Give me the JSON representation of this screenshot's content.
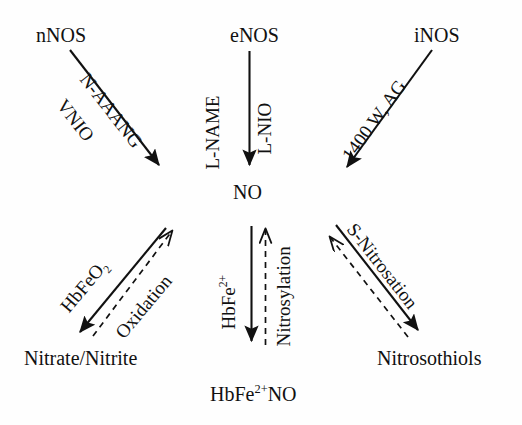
{
  "diagram": {
    "background_color": "#fefefe",
    "stroke_color": "#111111",
    "nodes": {
      "nnos": "nNOS",
      "enos": "eNOS",
      "inos": "iNOS",
      "no": "NO",
      "nitrate_nitrite": "Nitrate/Nitrite",
      "hbfe_no": "HbFe",
      "hbfe_no_sup": "2+",
      "hbfe_no_tail": "NO",
      "nitrosothiols": "Nitrosothiols"
    },
    "edge_labels": {
      "n_aaang": "N-AAANG",
      "vnio": "VNIO",
      "l_name": "L-NAME",
      "l_nio": "L-NIO",
      "w1400_ag": "1400 W, AG",
      "hbfeo2": "HbFeO",
      "hbfeo2_sub": "2",
      "oxidation": "Oxidation",
      "hbfe2": "HbFe",
      "hbfe2_sup": "2+",
      "nitrosylation": "Nitrosylation",
      "s_nitrosation": "S-Nitrosation"
    },
    "edges": [
      {
        "name": "nnos-to-no",
        "from": "nNOS",
        "to": "NO",
        "style": "solid",
        "inhibitors": [
          "N-AAANG",
          "VNIO"
        ]
      },
      {
        "name": "enos-to-no",
        "from": "eNOS",
        "to": "NO",
        "style": "solid",
        "inhibitors": [
          "L-NAME",
          "L-NIO"
        ]
      },
      {
        "name": "inos-to-no",
        "from": "iNOS",
        "to": "NO",
        "style": "solid",
        "inhibitors": [
          "1400 W, AG"
        ]
      },
      {
        "name": "no-to-nitrate-nitrite",
        "from": "NO",
        "to": "Nitrate/Nitrite",
        "style": "solid",
        "label": "HbFeO2"
      },
      {
        "name": "nitrate-nitrite-to-no",
        "from": "Nitrate/Nitrite",
        "to": "NO",
        "style": "dashed",
        "label": "Oxidation"
      },
      {
        "name": "no-to-hbfe-no",
        "from": "NO",
        "to": "HbFe2+NO",
        "style": "solid",
        "label": "HbFe2+"
      },
      {
        "name": "hbfe-no-to-no",
        "from": "HbFe2+NO",
        "to": "NO",
        "style": "dashed",
        "label": "Nitrosylation"
      },
      {
        "name": "no-to-nitrosothiols",
        "from": "NO",
        "to": "Nitrosothiols",
        "style": "solid",
        "label": "S-Nitrosation"
      },
      {
        "name": "nitrosothiols-to-no",
        "from": "Nitrosothiols",
        "to": "NO",
        "style": "dashed"
      }
    ]
  }
}
